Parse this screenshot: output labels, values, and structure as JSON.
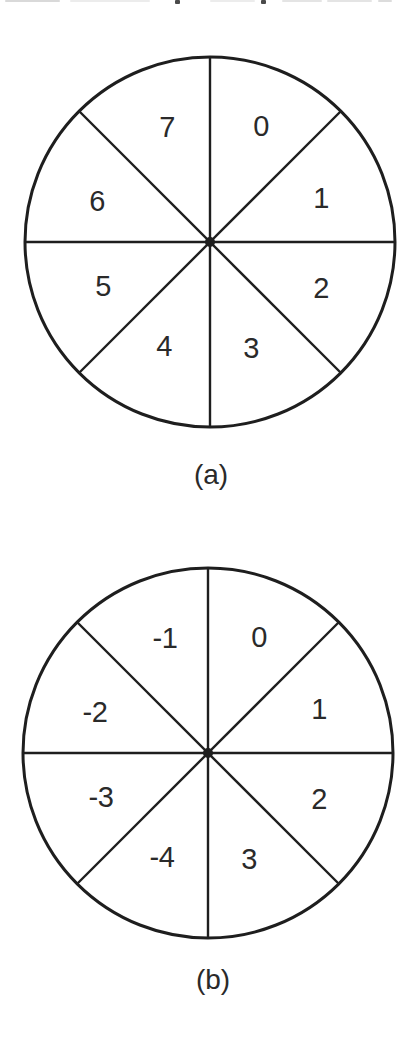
{
  "style": {
    "background": "#ffffff",
    "ink_color": "#1e1e1e",
    "label_color": "#2a2a2a"
  },
  "figure_a": {
    "caption": "(a)",
    "type": "number-wheel",
    "sector_count": 8,
    "sectors": [
      {
        "position": "top-right",
        "label": "0"
      },
      {
        "position": "right-upper",
        "label": "1"
      },
      {
        "position": "right-lower",
        "label": "2"
      },
      {
        "position": "bottom-right",
        "label": "3"
      },
      {
        "position": "bottom-left",
        "label": "4"
      },
      {
        "position": "left-lower",
        "label": "5"
      },
      {
        "position": "left-upper",
        "label": "6"
      },
      {
        "position": "top-left",
        "label": "7"
      }
    ]
  },
  "figure_b": {
    "caption": "(b)",
    "type": "number-wheel",
    "sector_count": 8,
    "sectors": [
      {
        "position": "top-right",
        "label": "0"
      },
      {
        "position": "right-upper",
        "label": "1"
      },
      {
        "position": "right-lower",
        "label": "2"
      },
      {
        "position": "bottom-right",
        "label": "3"
      },
      {
        "position": "bottom-left",
        "label": "-4"
      },
      {
        "position": "left-lower",
        "label": "-3"
      },
      {
        "position": "left-upper",
        "label": "-2"
      },
      {
        "position": "top-left",
        "label": "-1"
      }
    ]
  }
}
